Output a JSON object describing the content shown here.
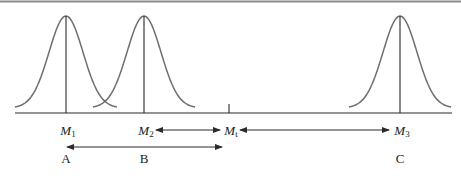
{
  "figure": {
    "colors": {
      "curve": "#6e6e6e",
      "line": "#2a2a2a",
      "top_border": "#8a8a8a",
      "background": "#ffffff"
    },
    "means": [
      {
        "id": "M1",
        "symbol": "M",
        "subscript": "1",
        "x": 66,
        "group_label": "A"
      },
      {
        "id": "M2",
        "symbol": "M",
        "subscript": "2",
        "x": 144,
        "group_label": "B"
      },
      {
        "id": "M3",
        "symbol": "M",
        "subscript": "3",
        "x": 400,
        "group_label": "C"
      }
    ],
    "threshold": {
      "id": "Mt",
      "symbol": "M",
      "subscript": "t",
      "x": 229
    },
    "arrows": [
      {
        "from": "M2",
        "to": "Mt",
        "row": "mean-labels",
        "bidirectional": true
      },
      {
        "from": "Mt",
        "to": "M3",
        "row": "mean-labels",
        "bidirectional": true
      },
      {
        "from": "M1",
        "to": "Mt",
        "row": "below",
        "bidirectional": true
      }
    ]
  },
  "labels": {
    "m1": {
      "sym": "M",
      "sub": "1"
    },
    "m2": {
      "sym": "M",
      "sub": "2"
    },
    "mt": {
      "sym": "M",
      "sub": "t"
    },
    "m3": {
      "sym": "M",
      "sub": "3"
    },
    "a": "A",
    "b": "B",
    "c": "C"
  }
}
